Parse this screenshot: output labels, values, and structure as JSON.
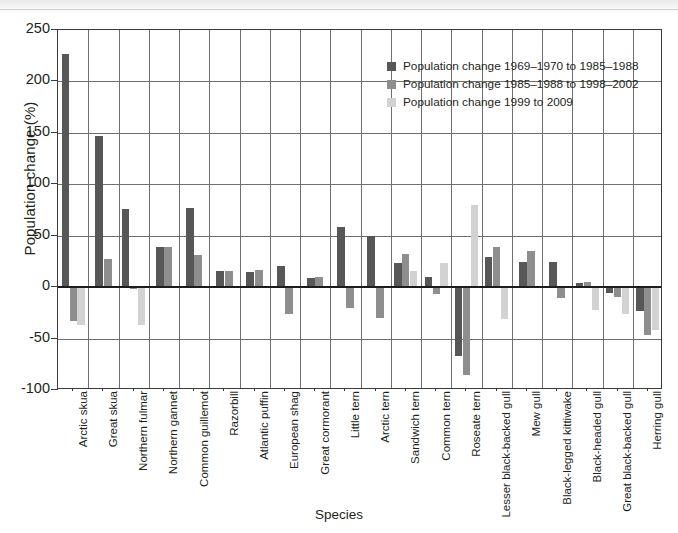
{
  "chart_data": {
    "type": "bar",
    "title": "",
    "xlabel": "Species",
    "ylabel": "Population change (%)",
    "ylim": [
      -100,
      250
    ],
    "yticks": [
      -100,
      -50,
      0,
      50,
      100,
      150,
      200,
      250
    ],
    "ytick_labels": [
      "-100",
      "-50",
      "0",
      "50",
      "100",
      "150",
      "200",
      "250"
    ],
    "grid": "vertical-and-horizontal",
    "legend_position": "top-right-inside",
    "categories": [
      "Arctic skua",
      "Great skua",
      "Northern fulmar",
      "Northern gannet",
      "Common guillemot",
      "Razorbill",
      "Atlantic puffin",
      "European shag",
      "Great cormorant",
      "Little tern",
      "Arctic tern",
      "Sandwich tern",
      "Common tern",
      "Roseate tern",
      "Lesser black-backed gull",
      "Mew gull",
      "Black-legged kittiwake",
      "Black-headed gull",
      "Great black-backed gull",
      "Herring gull"
    ],
    "series": [
      {
        "name": "Population change 1969–1970 to 1985–1988",
        "color": "#575757",
        "values": [
          227,
          147,
          76,
          39,
          77,
          16,
          15,
          21,
          9,
          58,
          50,
          23,
          10,
          -67,
          29,
          24,
          24,
          4,
          -6,
          -23
        ]
      },
      {
        "name": "Population change 1985–1988 to 1998–2002",
        "color": "#8e8e8e",
        "values": [
          -33,
          27,
          -2,
          39,
          31,
          16,
          17,
          -26,
          10,
          -20,
          -30,
          32,
          -7,
          -85,
          39,
          35,
          -11,
          5,
          -10,
          -47
        ]
      },
      {
        "name": "Population change 1999 to 2009",
        "color": "#d2d2d2",
        "values": [
          -37,
          0,
          -37,
          0,
          0,
          0,
          0,
          0,
          0,
          0,
          0,
          16,
          23,
          80,
          -31,
          0,
          0,
          -22,
          -26,
          -42
        ]
      }
    ]
  },
  "legend": {
    "entries": [
      "Population change 1969–1970 to 1985–1988",
      "Population change 1985–1988 to 1998–2002",
      "Population change 1999 to 2009"
    ]
  },
  "axes": {
    "y_title": "Population change (%)",
    "x_title": "Species"
  }
}
